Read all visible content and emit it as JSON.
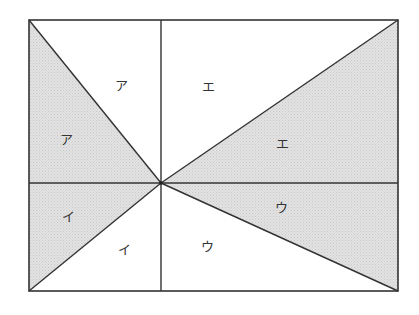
{
  "diagram": {
    "type": "geometric-area-division",
    "colors": {
      "stroke": "#333333",
      "shade": "#dcdcdc",
      "background": "#ffffff"
    },
    "rectangle": {
      "left": 29,
      "top": 20,
      "right": 398,
      "bottom": 291
    },
    "center": {
      "x": 161,
      "y": 183
    },
    "labels": [
      {
        "id": "a-upper",
        "text": "ア",
        "x": 121,
        "y": 90,
        "shaded": false
      },
      {
        "id": "a-lower",
        "text": "ア",
        "x": 66,
        "y": 144,
        "shaded": true
      },
      {
        "id": "e-upper",
        "text": "エ",
        "x": 208,
        "y": 91,
        "shaded": false
      },
      {
        "id": "e-lower",
        "text": "エ",
        "x": 282,
        "y": 148,
        "shaded": true
      },
      {
        "id": "i-left",
        "text": "イ",
        "x": 68,
        "y": 221,
        "shaded": true
      },
      {
        "id": "i-lower",
        "text": "イ",
        "x": 124,
        "y": 254,
        "shaded": false
      },
      {
        "id": "u-right",
        "text": "ウ",
        "x": 281,
        "y": 212,
        "shaded": true
      },
      {
        "id": "u-lower",
        "text": "ウ",
        "x": 207,
        "y": 251,
        "shaded": false
      }
    ]
  }
}
